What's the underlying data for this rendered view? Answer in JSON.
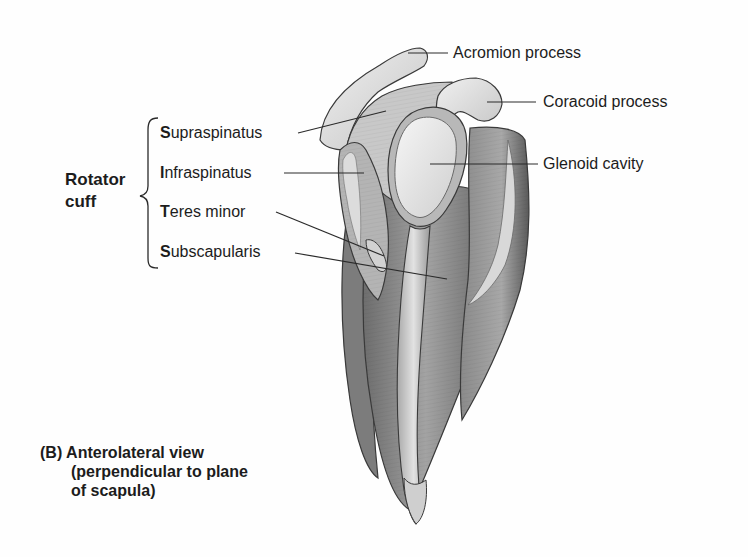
{
  "figure": {
    "view_caption": {
      "letter": "(B)",
      "line1": "Anterolateral view",
      "line2": "(perpendicular to plane",
      "line3": "of scapula)"
    },
    "group": {
      "title_line1": "Rotator",
      "title_line2": "cuff"
    },
    "left_labels": [
      {
        "initial": "S",
        "rest": "upraspinatus"
      },
      {
        "initial": "I",
        "rest": "nfraspinatus"
      },
      {
        "initial": "T",
        "rest": "eres minor"
      },
      {
        "initial": "S",
        "rest": "ubscapularis"
      }
    ],
    "right_labels": [
      {
        "text": "Acromion process"
      },
      {
        "text": "Coracoid process"
      },
      {
        "text": "Glenoid cavity"
      }
    ],
    "colors": {
      "line": "#2a2a2a",
      "bone_light": "#e4e4e4",
      "bone_mid": "#c9c9c9",
      "muscle_dark": "#7a7a7a",
      "muscle_mid": "#9d9d9d",
      "outline": "#3a3a3a"
    }
  }
}
